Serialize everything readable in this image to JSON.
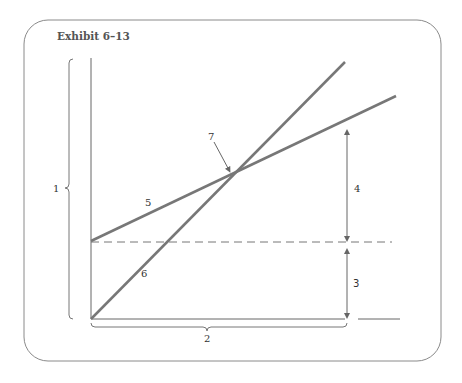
{
  "exhibit": {
    "title": "Exhibit 6–13"
  },
  "labels": {
    "l1": "1",
    "l2": "2",
    "l3": "3",
    "l4": "4",
    "l5": "5",
    "l6": "6",
    "l7": "7"
  },
  "colors": {
    "frame": "#8a8a8a",
    "axis": "#666666",
    "line_primary": "#777777",
    "dashed": "#777777",
    "text": "#333333",
    "title": "#555555"
  }
}
